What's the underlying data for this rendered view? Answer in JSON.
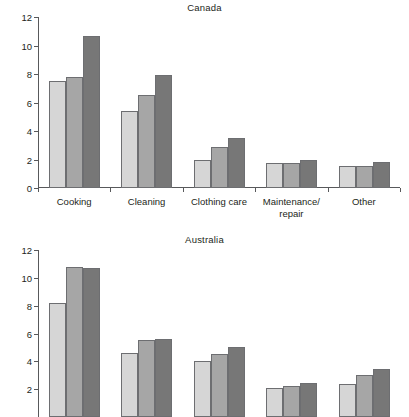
{
  "chart_data": [
    {
      "type": "bar",
      "title": "Canada",
      "xlabel": "",
      "ylabel": "",
      "ylim": [
        0,
        12
      ],
      "yticks": [
        0,
        2,
        4,
        6,
        8,
        10,
        12
      ],
      "ytick_labels": [
        "0",
        "2",
        "4",
        "6",
        "8",
        "10",
        "12"
      ],
      "grid": false,
      "legend": "none",
      "categories": [
        "Cooking",
        "Cleaning",
        "Clothing care",
        "Maintenance/\nrepair",
        "Other"
      ],
      "series": [
        {
          "name": "series-1",
          "color": "#d6d6d6",
          "values": [
            7.5,
            5.4,
            2.0,
            1.75,
            1.55
          ]
        },
        {
          "name": "series-2",
          "color": "#a6a6a6",
          "values": [
            7.8,
            6.5,
            2.9,
            1.75,
            1.55
          ]
        },
        {
          "name": "series-3",
          "color": "#777777",
          "values": [
            10.7,
            7.95,
            3.5,
            1.95,
            1.85
          ]
        }
      ]
    },
    {
      "type": "bar",
      "title": "Australia",
      "xlabel": "",
      "ylabel": "",
      "ylim": [
        0,
        12
      ],
      "yticks": [
        2,
        4,
        6,
        8,
        10,
        12
      ],
      "ytick_labels": [
        "2",
        "4",
        "6",
        "8",
        "10",
        "12"
      ],
      "grid": false,
      "legend": "none",
      "note_clipped_bottom": true,
      "categories": [
        "",
        "",
        "",
        "",
        ""
      ],
      "series": [
        {
          "name": "series-1",
          "color": "#d6d6d6",
          "values": [
            8.2,
            4.6,
            4.0,
            2.1,
            2.35
          ]
        },
        {
          "name": "series-2",
          "color": "#a6a6a6",
          "values": [
            10.8,
            5.55,
            4.5,
            2.25,
            3.05
          ]
        },
        {
          "name": "series-3",
          "color": "#777777",
          "values": [
            10.7,
            5.6,
            5.0,
            2.45,
            3.45
          ]
        }
      ]
    }
  ]
}
